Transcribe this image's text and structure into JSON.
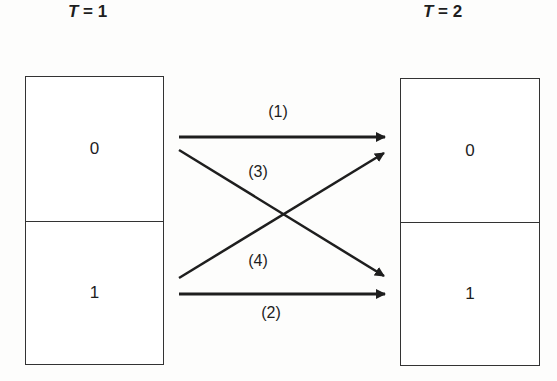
{
  "diagram": {
    "left_period": {
      "var": "T",
      "eq": " = ",
      "value": "1"
    },
    "right_period": {
      "var": "T",
      "eq": " = ",
      "value": "2"
    },
    "left_states": [
      "0",
      "1"
    ],
    "right_states": [
      "0",
      "1"
    ],
    "transitions": [
      {
        "label": "(1)",
        "from": "0",
        "to": "0"
      },
      {
        "label": "(2)",
        "from": "1",
        "to": "1"
      },
      {
        "label": "(3)",
        "from": "0",
        "to": "1"
      },
      {
        "label": "(4)",
        "from": "1",
        "to": "0"
      }
    ],
    "line_color": "#1e1e1e"
  }
}
